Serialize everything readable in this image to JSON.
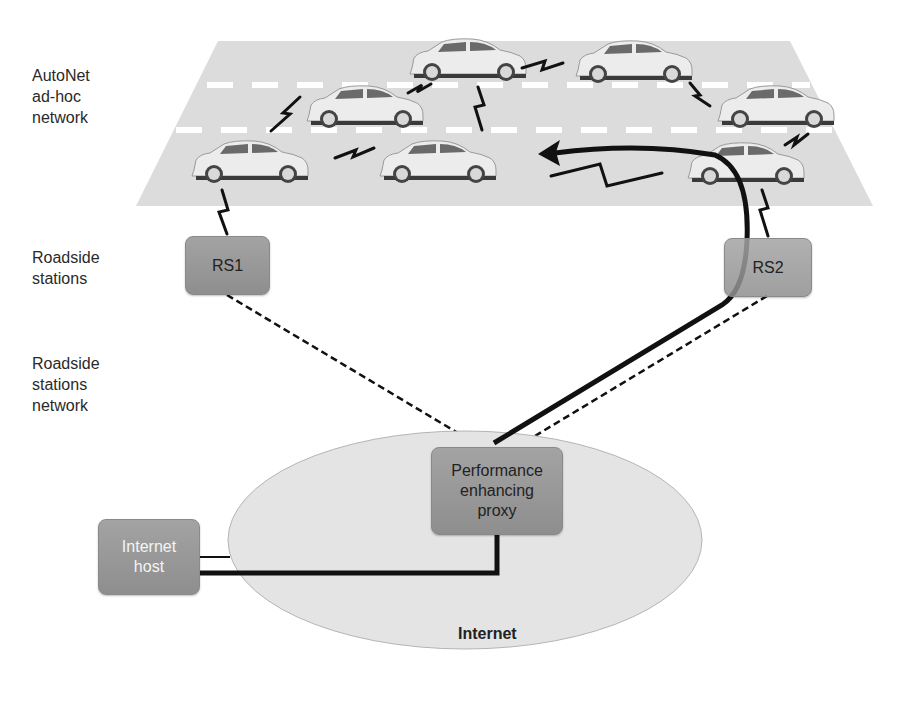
{
  "left_labels": {
    "autonet": [
      "AutoNet",
      "ad-hoc",
      "network"
    ],
    "roadside_stations": [
      "Roadside",
      "stations"
    ],
    "roadside_network": [
      "Roadside",
      "stations",
      "network"
    ]
  },
  "nodes": {
    "rs1": "RS1",
    "rs2": "RS2",
    "proxy": [
      "Performance",
      "enhancing",
      "proxy"
    ],
    "internet_host": [
      "Internet",
      "host"
    ],
    "internet": "Internet"
  },
  "colors": {
    "road": "#dcdcdc",
    "lane_dash": "#ffffff",
    "box": "#999999",
    "ellipse": "#e6e6e6",
    "path": "#111111"
  }
}
